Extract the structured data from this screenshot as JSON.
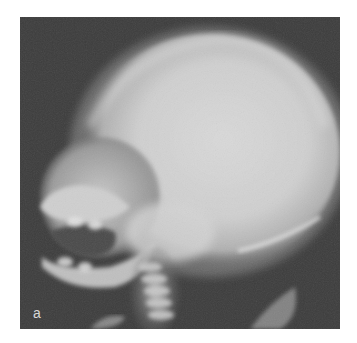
{
  "figure": {
    "panel_label": "a",
    "colors": {
      "background": "#3a3a3a",
      "bone_bright": "#e6e6e6",
      "bone_mid": "#bdbdbd",
      "page": "#ffffff"
    }
  }
}
